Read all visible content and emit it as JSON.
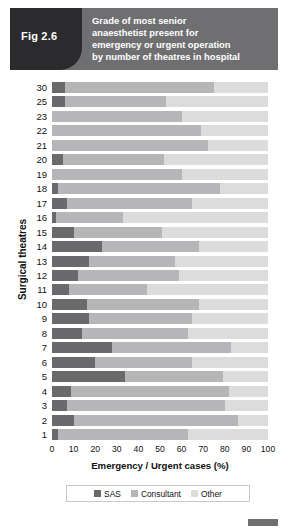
{
  "figure": {
    "tag": "Fig 2.6",
    "title_lines": [
      "Grade of most senior",
      "anaesthetist present for",
      "emergency or urgent operation",
      "by number of theatres in hospital"
    ]
  },
  "legend": {
    "items": [
      {
        "label": "SAS",
        "color": "#6a6a6d"
      },
      {
        "label": "Consultant",
        "color": "#b6b6b8"
      },
      {
        "label": "Other",
        "color": "#dcdcdc"
      }
    ]
  },
  "axes": {
    "x_title": "Emergency / Urgent cases (%)",
    "y_title": "Surgical theatres",
    "x_ticks": [
      "0",
      "10",
      "20",
      "30",
      "40",
      "50",
      "60",
      "70",
      "80",
      "90",
      "100"
    ]
  },
  "chart_data": {
    "type": "bar",
    "orientation": "horizontal",
    "stacked": true,
    "percent": true,
    "title": "Grade of most senior anaesthetist present for emergency or urgent operation by number of theatres in hospital",
    "xlabel": "Emergency / Urgent cases (%)",
    "ylabel": "Surgical theatres",
    "xlim": [
      0,
      100
    ],
    "xticks": [
      0,
      10,
      20,
      30,
      40,
      50,
      60,
      70,
      80,
      90,
      100
    ],
    "grid": true,
    "legend_position": "bottom",
    "categories": [
      "30",
      "25",
      "23",
      "22",
      "21",
      "20",
      "19",
      "18",
      "17",
      "16",
      "15",
      "14",
      "13",
      "12",
      "11",
      "10",
      "9",
      "8",
      "7",
      "6",
      "5",
      "4",
      "3",
      "2",
      "1"
    ],
    "series": [
      {
        "name": "SAS",
        "color": "#6a6a6d",
        "values": [
          6,
          6,
          0,
          0,
          0,
          5,
          0,
          3,
          7,
          2,
          10,
          23,
          17,
          12,
          8,
          16,
          17,
          14,
          28,
          20,
          34,
          9,
          7,
          10,
          3
        ]
      },
      {
        "name": "Consultant",
        "color": "#b6b6b8",
        "values": [
          69,
          47,
          60,
          69,
          72,
          47,
          60,
          75,
          58,
          31,
          41,
          45,
          40,
          47,
          36,
          52,
          48,
          49,
          55,
          45,
          45,
          73,
          73,
          76,
          60
        ]
      },
      {
        "name": "Other",
        "color": "#dcdcdc",
        "values": [
          25,
          47,
          40,
          31,
          28,
          48,
          40,
          22,
          35,
          67,
          49,
          32,
          43,
          41,
          56,
          32,
          35,
          37,
          17,
          35,
          21,
          18,
          20,
          14,
          37
        ]
      }
    ]
  }
}
